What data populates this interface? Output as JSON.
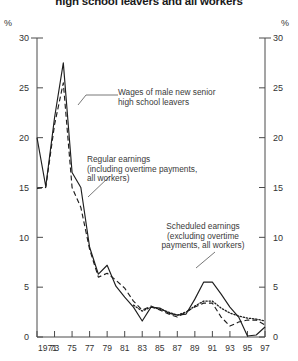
{
  "title": "high school leavers and all workers",
  "axis": {
    "unit_left": "%",
    "unit_right": "%",
    "y_ticks": [
      "0",
      "5",
      "10",
      "15",
      "20",
      "25",
      "30"
    ],
    "x_ticks": [
      "1971",
      "73",
      "75",
      "77",
      "79",
      "81",
      "83",
      "85",
      "87",
      "89",
      "91",
      "93",
      "95",
      "97"
    ]
  },
  "annotations": {
    "a1": {
      "l1": "Wages of male new senior",
      "l2": "high school leavers"
    },
    "a2": {
      "l1": "Regular earnings",
      "l2": "(including overtime payments,",
      "l3": "all workers)"
    },
    "a3": {
      "l1": "Scheduled earnings",
      "l2": "(excluding overtime",
      "l3": "payments, all workers)"
    }
  },
  "chart_data": {
    "type": "line",
    "title": "high school leavers and all workers",
    "xlabel": "",
    "ylabel": "%",
    "xlim": [
      1971,
      1997
    ],
    "ylim": [
      0,
      30
    ],
    "grid": false,
    "legend": "annotations-inline",
    "x": [
      1971,
      1972,
      1973,
      1974,
      1975,
      1976,
      1977,
      1978,
      1979,
      1980,
      1981,
      1982,
      1983,
      1984,
      1985,
      1986,
      1987,
      1988,
      1989,
      1990,
      1991,
      1992,
      1993,
      1994,
      1995,
      1996,
      1997
    ],
    "series": [
      {
        "name": "Wages of male new senior high school leavers",
        "style": "solid",
        "values": [
          20.0,
          15.1,
          22.0,
          27.5,
          16.5,
          15.0,
          9.0,
          6.3,
          7.2,
          5.1,
          4.0,
          3.0,
          1.6,
          3.0,
          2.9,
          2.4,
          2.2,
          2.3,
          3.8,
          5.5,
          5.5,
          4.3,
          3.0,
          2.0,
          0.1,
          0.2,
          1.0
        ]
      },
      {
        "name": "Regular earnings (including overtime payments, all workers)",
        "style": "dashed",
        "values": [
          14.9,
          15.0,
          21.3,
          25.5,
          15.0,
          13.0,
          8.8,
          6.0,
          6.4,
          5.7,
          4.9,
          3.6,
          2.7,
          3.1,
          2.7,
          2.3,
          2.0,
          2.5,
          3.0,
          3.4,
          3.4,
          2.0,
          1.1,
          1.5,
          1.7,
          1.7,
          1.2
        ]
      },
      {
        "name": "Scheduled earnings (excluding overtime payments, all workers)",
        "style": "dotted",
        "values": [
          null,
          null,
          null,
          null,
          null,
          null,
          null,
          null,
          null,
          null,
          null,
          3.2,
          2.6,
          3.0,
          2.8,
          2.5,
          2.2,
          2.5,
          3.1,
          3.6,
          3.6,
          2.9,
          2.4,
          2.1,
          1.9,
          1.8,
          1.6
        ]
      }
    ]
  }
}
